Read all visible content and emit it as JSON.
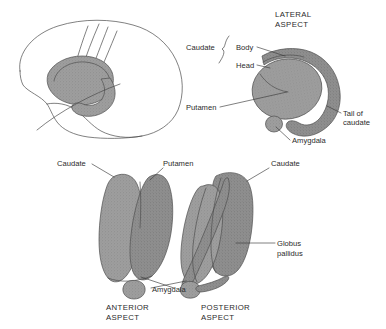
{
  "figure": {
    "background_color": "#ffffff",
    "structure_fill_color": "#9a9a9a",
    "structure_fill_color_dark": "#8a8a8a",
    "outline_color": "#4a4a4a",
    "text_color": "#2b2b2b",
    "leader_line_color": "#3a3a3a"
  },
  "panels": {
    "brain_outline": {
      "name": "sagittal-brain-outline",
      "caption": "",
      "has_caption": false
    },
    "lateral": {
      "name": "lateral-aspect",
      "heading_line1": "LATERAL",
      "heading_line2": "ASPECT",
      "labels": {
        "caudate": "Caudate",
        "body": "Body",
        "head": "Head",
        "putamen": "Putamen",
        "tail_line1": "Tail of",
        "tail_line2": "caudate",
        "amygdala": "Amygdala"
      }
    },
    "anterior": {
      "name": "anterior-aspect",
      "caption_line1": "ANTERIOR",
      "caption_line2": "ASPECT",
      "labels": {
        "caudate": "Caudate",
        "putamen": "Putamen",
        "amygdala": "Amygdala"
      }
    },
    "posterior": {
      "name": "posterior-aspect",
      "caption_line1": "POSTERIOR",
      "caption_line2": "ASPECT",
      "labels": {
        "caudate": "Caudate",
        "globus_line1": "Globus",
        "globus_line2": "pallidus"
      }
    }
  }
}
